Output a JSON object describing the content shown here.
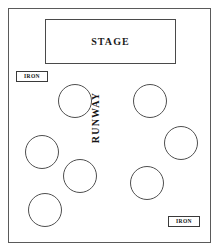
{
  "plan": {
    "stage": {
      "label": "STAGE"
    },
    "runway": {
      "label": "RUNWAY"
    },
    "iron_markers": [
      {
        "label": "IRON",
        "position": "left-upper"
      },
      {
        "label": "IRON",
        "position": "bottom-right"
      }
    ],
    "tables": [
      {
        "id": "table-1",
        "cx": 75,
        "cy": 101,
        "r": 17
      },
      {
        "id": "table-2",
        "cx": 150,
        "cy": 101,
        "r": 17
      },
      {
        "id": "table-3",
        "cx": 42,
        "cy": 152,
        "r": 17
      },
      {
        "id": "table-4",
        "cx": 181,
        "cy": 143,
        "r": 17
      },
      {
        "id": "table-5",
        "cx": 80,
        "cy": 176,
        "r": 17
      },
      {
        "id": "table-6",
        "cx": 147,
        "cy": 183,
        "r": 17
      },
      {
        "id": "table-7",
        "cx": 45,
        "cy": 210,
        "r": 17
      }
    ],
    "colors": {
      "outline": "#5a5a5a",
      "text": "#1a1a1a",
      "background": "#ffffff"
    }
  }
}
